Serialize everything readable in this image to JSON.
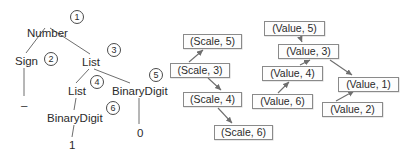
{
  "figure": {
    "stroke_color": "#6e6e6e",
    "box_border_color": "#8a8a8a",
    "text_color": "#2b2b2b"
  },
  "parse_tree": {
    "nodes": [
      {
        "id": "number",
        "label": "Number",
        "x": 27,
        "y": 27
      },
      {
        "id": "sign",
        "label": "Sign",
        "x": 15,
        "y": 55
      },
      {
        "id": "list1",
        "label": "List",
        "x": 82,
        "y": 56
      },
      {
        "id": "list2",
        "label": "List",
        "x": 68,
        "y": 85
      },
      {
        "id": "binarydigit1",
        "label": "BinaryDigit",
        "x": 112,
        "y": 85
      },
      {
        "id": "binarydigit2",
        "label": "BinaryDigit",
        "x": 47,
        "y": 112
      }
    ],
    "terminals": [
      {
        "id": "minus",
        "label": "–",
        "x": 21,
        "y": 99
      },
      {
        "id": "one",
        "label": "1",
        "x": 69,
        "y": 139
      },
      {
        "id": "zero",
        "label": "0",
        "x": 137,
        "y": 127
      }
    ],
    "annotations": [
      {
        "id": "ann-1",
        "label": "1",
        "x": 70,
        "y": 10
      },
      {
        "id": "ann-2",
        "label": "2",
        "x": 44,
        "y": 52
      },
      {
        "id": "ann-3",
        "label": "3",
        "x": 107,
        "y": 43
      },
      {
        "id": "ann-4",
        "label": "4",
        "x": 90,
        "y": 75
      },
      {
        "id": "ann-5",
        "label": "5",
        "x": 149,
        "y": 68
      },
      {
        "id": "ann-6",
        "label": "6",
        "x": 106,
        "y": 101
      }
    ]
  },
  "dependency_graph": {
    "boxes": [
      {
        "id": "scale5",
        "label": "(Scale, 5)",
        "x": 183,
        "y": 34,
        "w": 59
      },
      {
        "id": "scale3",
        "label": "(Scale, 3)",
        "x": 170,
        "y": 63,
        "w": 60
      },
      {
        "id": "scale4",
        "label": "(Scale, 4)",
        "x": 183,
        "y": 92,
        "w": 59
      },
      {
        "id": "scale6",
        "label": "(Scale, 6)",
        "x": 214,
        "y": 125,
        "w": 59
      },
      {
        "id": "value5",
        "label": "(Value, 5)",
        "x": 264,
        "y": 21,
        "w": 61
      },
      {
        "id": "value3",
        "label": "(Value, 3)",
        "x": 278,
        "y": 44,
        "w": 61
      },
      {
        "id": "value4",
        "label": "(Value, 4)",
        "x": 262,
        "y": 66,
        "w": 61
      },
      {
        "id": "value1",
        "label": "(Value, 1)",
        "x": 338,
        "y": 77,
        "w": 61
      },
      {
        "id": "value6",
        "label": "(Value, 6)",
        "x": 252,
        "y": 94,
        "w": 61
      },
      {
        "id": "value2",
        "label": "(Value, 2)",
        "x": 322,
        "y": 102,
        "w": 61
      }
    ],
    "edges": [
      {
        "from": "scale3",
        "to": "scale5"
      },
      {
        "from": "scale3",
        "to": "scale4"
      },
      {
        "from": "scale4",
        "to": "scale6"
      },
      {
        "from": "value5",
        "to": "value3"
      },
      {
        "from": "value4",
        "to": "value3"
      },
      {
        "from": "value3",
        "to": "value1"
      },
      {
        "from": "value6",
        "to": "value4"
      },
      {
        "from": "value2",
        "to": "value1"
      }
    ]
  }
}
